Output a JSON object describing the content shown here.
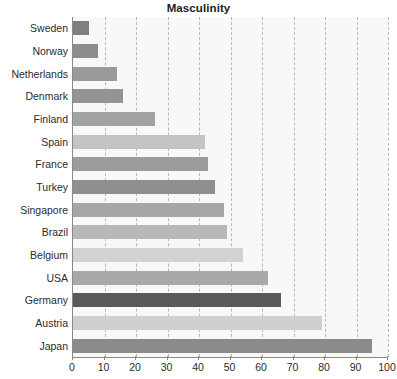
{
  "chart_data": {
    "type": "bar",
    "orientation": "horizontal",
    "title": "Masculinity",
    "xlabel": "",
    "ylabel": "",
    "xlim": [
      0,
      100
    ],
    "xticks": [
      0,
      10,
      20,
      30,
      40,
      50,
      60,
      70,
      80,
      90,
      100
    ],
    "grid": true,
    "grid_axis": "x",
    "grid_style": "dashed",
    "legend": false,
    "categories": [
      "Sweden",
      "Norway",
      "Netherlands",
      "Denmark",
      "Finland",
      "Spain",
      "France",
      "Turkey",
      "Singapore",
      "Brazil",
      "Belgium",
      "USA",
      "Germany",
      "Austria",
      "Japan"
    ],
    "values": [
      5,
      8,
      14,
      16,
      26,
      42,
      43,
      45,
      48,
      49,
      54,
      62,
      66,
      79,
      95
    ],
    "bar_colors": [
      "#7f7f7f",
      "#8c8c8c",
      "#9a9a9a",
      "#949494",
      "#a2a2a2",
      "#c4c4c4",
      "#9c9c9c",
      "#8f8f8f",
      "#a6a6a6",
      "#b8b8b8",
      "#d2d2d2",
      "#a9a9a9",
      "#5a5a5a",
      "#cfcfcf",
      "#8b8b8b"
    ]
  },
  "style": {
    "plot_background": "#f8f8f7",
    "axis_color": "#8a8a8a",
    "gridline_color": "#b9b9b9",
    "text_color": "#2b2b2b",
    "title_color": "#1c1c1c"
  }
}
